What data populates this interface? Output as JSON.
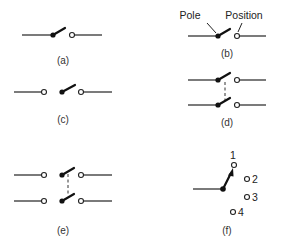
{
  "diagram": {
    "type": "switch-configurations",
    "panels": [
      {
        "id": "a",
        "label": "(a)",
        "description": "single pole single throw, open"
      },
      {
        "id": "b",
        "label": "(b)",
        "description": "single pole single throw with annotations",
        "annotations": [
          "Pole",
          "Position"
        ]
      },
      {
        "id": "c",
        "label": "(c)",
        "description": "single pole double throw"
      },
      {
        "id": "d",
        "label": "(d)",
        "description": "double pole single throw, ganged"
      },
      {
        "id": "e",
        "label": "(e)",
        "description": "double pole double throw, ganged"
      },
      {
        "id": "f",
        "label": "(f)",
        "description": "single pole four position rotary",
        "positions": [
          "1",
          "2",
          "3",
          "4"
        ]
      }
    ],
    "annotations": {
      "pole": "Pole",
      "position": "Position"
    },
    "labels": {
      "a": "(a)",
      "b": "(b)",
      "c": "(c)",
      "d": "(d)",
      "e": "(e)",
      "f": "(f)"
    },
    "positions": {
      "p1": "1",
      "p2": "2",
      "p3": "3",
      "p4": "4"
    }
  }
}
